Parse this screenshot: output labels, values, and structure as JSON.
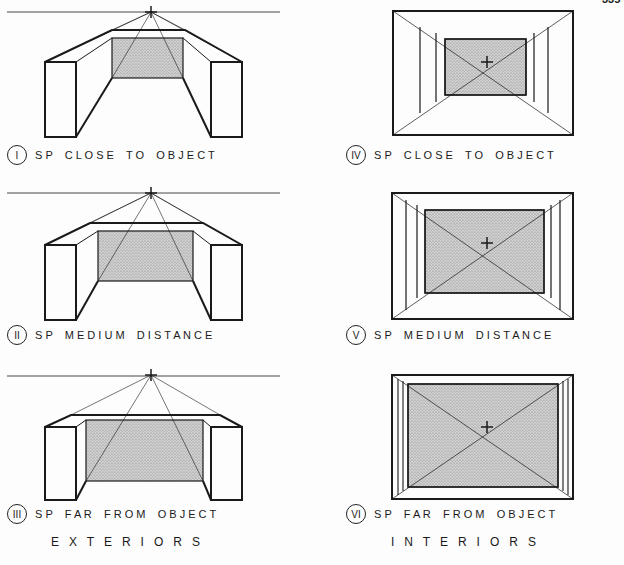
{
  "page": {
    "number_partial": "335"
  },
  "colors": {
    "ink": "#1a1a1a",
    "stipple": "#bdbdbd",
    "paper": "#fdfdfd"
  },
  "panels": [
    {
      "id": "I",
      "numeral": "I",
      "caption": "S P    C L O S E    T O    O B J E C T",
      "kind": "exterior"
    },
    {
      "id": "II",
      "numeral": "II",
      "caption": "S P    M E D I U M    D I S T A N C E",
      "kind": "exterior"
    },
    {
      "id": "III",
      "numeral": "III",
      "caption": "S P    F A R    F R O M    O B J E C T",
      "kind": "exterior"
    },
    {
      "id": "IV",
      "numeral": "IV",
      "caption": "S P    C L O S E    T O    O B J E C T",
      "kind": "interior"
    },
    {
      "id": "V",
      "numeral": "V",
      "caption": "S P    M E D I U M    D I S T A N C E",
      "kind": "interior"
    },
    {
      "id": "VI",
      "numeral": "VI",
      "caption": "S P    F A R    F R O M    O B J E C T",
      "kind": "interior"
    }
  ],
  "sections": {
    "exteriors": "E   X   T   E   R   I   O   R   S",
    "interiors": "I   N   T   E   R   I   O   R   S"
  }
}
